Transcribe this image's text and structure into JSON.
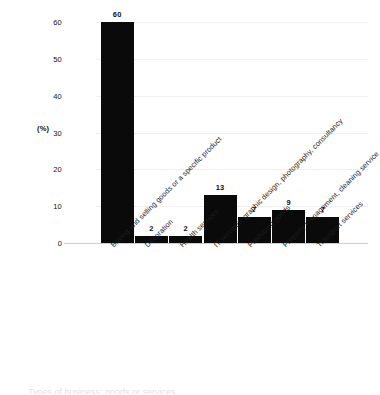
{
  "chart_data": {
    "type": "bar",
    "title": "",
    "xlabel": "",
    "ylabel": "(%)",
    "ylim": [
      0,
      60
    ],
    "yticks": [
      "0",
      "10",
      "20",
      "30",
      "40",
      "50",
      "60"
    ],
    "grid": true,
    "legend": "none",
    "orientation": "vertical",
    "bar_color": "#0a0a0a",
    "categories": [
      "Buying and selling goods or a specific product",
      "Decoration",
      "Health services",
      "IT services, graphic design, photography, consultancy",
      "Producing goods",
      "Property management, cleaning service",
      "Transport services"
    ],
    "values": [
      60,
      2,
      2,
      13,
      7,
      9,
      7
    ],
    "value_labels": [
      "60",
      "2",
      "2",
      "13",
      "7",
      "9",
      "7"
    ]
  },
  "footer": {
    "partial_text": "Types of business: goods or services"
  }
}
